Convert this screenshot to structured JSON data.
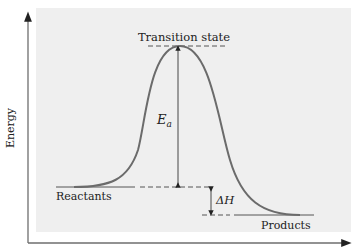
{
  "diagram": {
    "y_axis_label": "Energy",
    "labels": {
      "transition_state": "Transition state",
      "activation_energy_symbol": "E",
      "activation_energy_subscript": "a",
      "enthalpy_symbol": "ΔH",
      "reactants": "Reactants",
      "products": "Products"
    },
    "colors": {
      "panel": "#efefef",
      "curve": "#6b6b6b",
      "axis": "#6e6e6e",
      "text": "#222222"
    }
  }
}
